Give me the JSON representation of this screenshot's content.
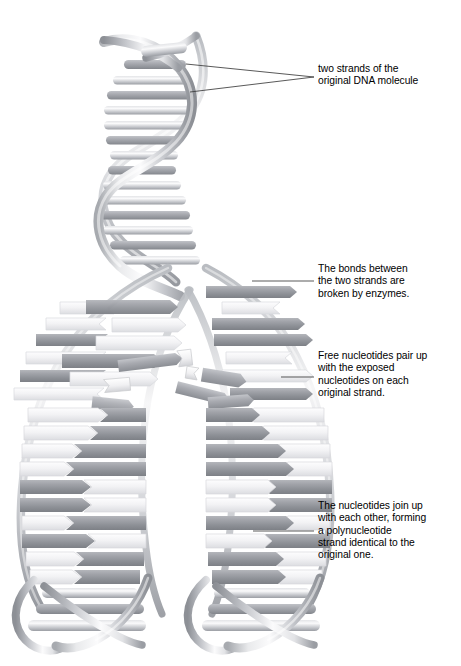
{
  "figure": {
    "background_color": "#ffffff"
  },
  "palette": {
    "strand_light": "#f4f4f6",
    "strand_mid": "#c9cbd0",
    "strand_dark": "#8e9197",
    "nucleotide_dark": "#9a9ca2",
    "nucleotide_dark_shadow": "#7e8187",
    "nucleotide_light": "#f2f2f4",
    "nucleotide_light_edge": "#d6d7db",
    "leader_line": "#3b3b3b",
    "text": "#000000"
  },
  "annotations": [
    {
      "id": "ann-0",
      "name": "label-original-strands",
      "text": "two strands of the\noriginal DNA molecule",
      "leader_lines": 2
    },
    {
      "id": "ann-1",
      "name": "label-bonds-broken",
      "text": "The bonds between\nthe two strands are\nbroken by enzymes.",
      "leader_lines": 1
    },
    {
      "id": "ann-2",
      "name": "label-free-nucleotides",
      "text": "Free nucleotides pair up\nwith the exposed\nnucleotides on each\noriginal strand.",
      "leader_lines": 1
    },
    {
      "id": "ann-3",
      "name": "label-nucleotides-join",
      "text": "The nucleotides join up\nwith each other, forming\na polynucleotide\nstrand identical to the\noriginal one.",
      "leader_lines": 1
    }
  ],
  "structure": {
    "top_helix": {
      "name": "original-double-helix",
      "description": "intact double helix with paired base rungs",
      "turns": 2
    },
    "replication_fork": {
      "name": "replication-fork",
      "description": "point where the two original strands separate"
    },
    "left_arm": {
      "name": "left-daughter-strand",
      "description": "original left strand with newly paired nucleotides"
    },
    "right_arm": {
      "name": "right-daughter-strand",
      "description": "original right strand with newly paired nucleotides"
    },
    "free_nucleotides": {
      "name": "free-nucleotide-pool",
      "count": 6
    },
    "bottom_helices": {
      "name": "new-daughter-helices",
      "count": 2
    }
  }
}
